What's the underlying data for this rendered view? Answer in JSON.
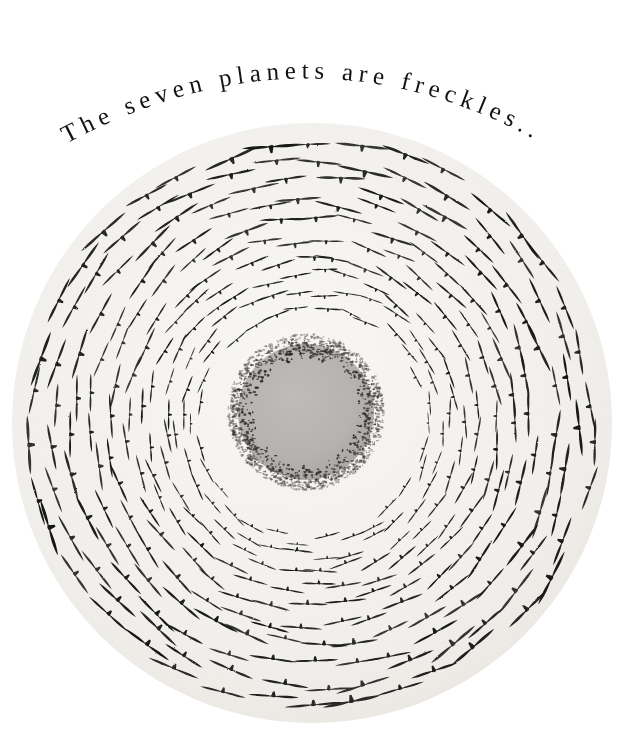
{
  "artwork": {
    "title": "The seven planets are freckles...",
    "medium_description": "Ink drawing of a circular flock of birds spiralling around a pale grey disc",
    "background_color": "#ffffff"
  },
  "caption": {
    "text": "The seven planets are freckles...",
    "color": "#15130f",
    "arc": {
      "start_x": 62,
      "start_y": 146,
      "apex_x": 305,
      "apex_y": 66,
      "end_x": 536,
      "end_y": 140,
      "sweep_radius": 420
    }
  },
  "flock": {
    "center_x": 312,
    "center_y": 423,
    "outer_radius": 300,
    "bird_color": "#141414",
    "paper_color": "#f5f3ef",
    "rings": [
      {
        "index": 0,
        "radius": 118,
        "count": 30,
        "bird_length": 26,
        "bird_thickness": 4.2,
        "angle_offset": 0
      },
      {
        "index": 1,
        "radius": 133,
        "count": 32,
        "bird_length": 29,
        "bird_thickness": 4.6,
        "angle_offset": 5
      },
      {
        "index": 2,
        "radius": 149,
        "count": 33,
        "bird_length": 32,
        "bird_thickness": 5.0,
        "angle_offset": 11
      },
      {
        "index": 3,
        "radius": 166,
        "count": 34,
        "bird_length": 35,
        "bird_thickness": 5.4,
        "angle_offset": 4
      },
      {
        "index": 4,
        "radius": 184,
        "count": 35,
        "bird_length": 38,
        "bird_thickness": 5.8,
        "angle_offset": 9
      },
      {
        "index": 5,
        "radius": 203,
        "count": 36,
        "bird_length": 41,
        "bird_thickness": 6.2,
        "angle_offset": 2
      },
      {
        "index": 6,
        "radius": 222,
        "count": 36,
        "bird_length": 44,
        "bird_thickness": 6.6,
        "angle_offset": 8
      },
      {
        "index": 7,
        "radius": 242,
        "count": 37,
        "bird_length": 47,
        "bird_thickness": 7.0,
        "angle_offset": 3
      },
      {
        "index": 8,
        "radius": 262,
        "count": 37,
        "bird_length": 50,
        "bird_thickness": 7.4,
        "angle_offset": 10
      },
      {
        "index": 9,
        "radius": 281,
        "count": 38,
        "bird_length": 52,
        "bird_thickness": 7.7,
        "angle_offset": 5
      }
    ]
  },
  "core": {
    "label": "grey planet disc",
    "center_x": 306,
    "center_y": 412,
    "radius": 68,
    "fill_color": "#b4b3b1",
    "stipple": {
      "label": "speckled halo of distant birds",
      "inner_radius": 52,
      "outer_radius": 78,
      "dot_count": 1400,
      "dot_color": "#2a2724"
    }
  }
}
